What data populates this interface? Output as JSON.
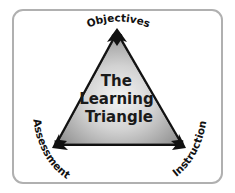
{
  "diagram": {
    "title_lines": [
      "The",
      "Learning",
      "Triangle"
    ],
    "vertices": {
      "top": {
        "label": "Objectives"
      },
      "bottom_left": {
        "label": "Assessment"
      },
      "bottom_right": {
        "label": "Instruction"
      }
    },
    "colors": {
      "frame_border": "#b0b0b0",
      "frame_fill": "#ffffff",
      "triangle_center": "#f2f2f2",
      "triangle_edge": "#8c8c8c",
      "arrow": "#111111",
      "text": "#111111"
    }
  }
}
